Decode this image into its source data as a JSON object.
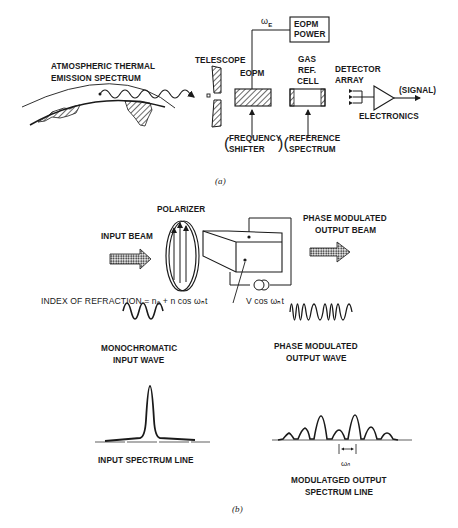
{
  "figure_a": {
    "caption": "(a)",
    "labels": {
      "atmospheric_line1": "ATMOSPHERIC THERMAL",
      "atmospheric_line2": "EMISSION SPECTRUM",
      "telescope": "TELESCOPE",
      "eopm": "EOPM",
      "omega_e": "ωE",
      "eopm_power_line1": "EOPM",
      "eopm_power_line2": "POWER",
      "gas_line1": "GAS",
      "gas_line2": "REF.",
      "gas_line3": "CELL",
      "detector_line1": "DETECTOR",
      "detector_line2": "ARRAY",
      "signal": "(SIGNAL)",
      "electronics": "ELECTRONICS",
      "freq_shifter_line1": "FREQUENCY",
      "freq_shifter_line2": "SHIFTER",
      "ref_spectrum_line1": "REFERENCE",
      "ref_spectrum_line2": "SPECTRUM"
    }
  },
  "figure_b": {
    "caption": "(b)",
    "labels": {
      "polarizer": "POLARIZER",
      "input_beam": "INPUT BEAM",
      "phase_mod_beam_line1": "PHASE MODULATED",
      "phase_mod_beam_line2": "OUTPUT BEAM",
      "index_refraction": "INDEX OF REFRACTION = n₀ + n cos ωₙt",
      "voltage": "V cos ωₙt",
      "mono_line1": "MONOCHROMATIC",
      "mono_line2": "INPUT WAVE",
      "pm_wave_line1": "PHASE MODULATED",
      "pm_wave_line2": "OUTPUT WAVE",
      "input_spectrum": "INPUT SPECTRUM LINE",
      "omega_n": "ωₙ",
      "mod_spectrum_line1": "MODULATGED OUTPUT",
      "mod_spectrum_line2": "SPECTRUM LINE"
    }
  },
  "colors": {
    "ink": "#1a1a1a",
    "background": "#ffffff"
  }
}
